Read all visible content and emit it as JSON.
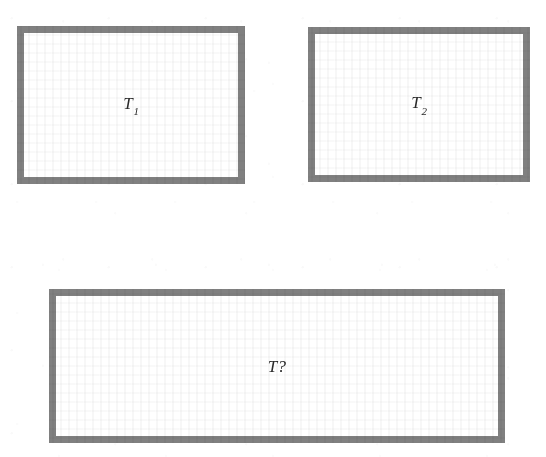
{
  "diagram": {
    "type": "rectangle-composition",
    "background_color": "#ffffff",
    "border_color": "#808080",
    "border_width_px": 7,
    "label_color": "#2a2a2a",
    "boxes": [
      {
        "id": "box-t1",
        "name": "rectangle-t1",
        "label_base": "T",
        "label_sub": "1",
        "label_full": "T1",
        "row": "top",
        "position": "left",
        "x": 17,
        "y": 26,
        "width": 228,
        "height": 158
      },
      {
        "id": "box-t2",
        "name": "rectangle-t2",
        "label_base": "T",
        "label_sub": "2",
        "label_full": "T2",
        "row": "top",
        "position": "right",
        "x": 308,
        "y": 27,
        "width": 222,
        "height": 155
      },
      {
        "id": "box-tq",
        "name": "rectangle-t-unknown",
        "label_base": "T",
        "label_sub": "?",
        "label_full": "T?",
        "row": "bottom",
        "position": "center",
        "x": 49,
        "y": 289,
        "width": 456,
        "height": 154
      }
    ]
  }
}
